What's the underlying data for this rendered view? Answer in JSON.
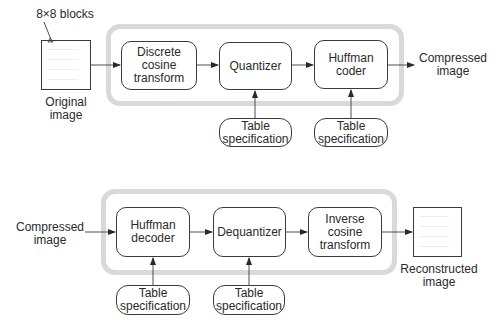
{
  "encoder": {
    "blocks_label": "8×8 blocks",
    "input_label": "Original\nimage",
    "stages": [
      {
        "label": "Discrete\ncosine\ntransform"
      },
      {
        "label": "Quantizer"
      },
      {
        "label": "Huffman\ncoder"
      }
    ],
    "table_specs": [
      {
        "label": "Table\nspecification"
      },
      {
        "label": "Table\nspecification"
      }
    ],
    "output_label": "Compressed\nimage"
  },
  "decoder": {
    "input_label": "Compressed\nimage",
    "stages": [
      {
        "label": "Huffman\ndecoder"
      },
      {
        "label": "Dequantizer"
      },
      {
        "label": "Inverse\ncosine\ntransform"
      }
    ],
    "table_specs": [
      {
        "label": "Table\nspecification"
      },
      {
        "label": "Table\nspecification"
      }
    ],
    "output_label": "Reconstructed\nimage"
  },
  "colors": {
    "frame": "#d9d9d9",
    "stroke": "#3a3a3a"
  }
}
